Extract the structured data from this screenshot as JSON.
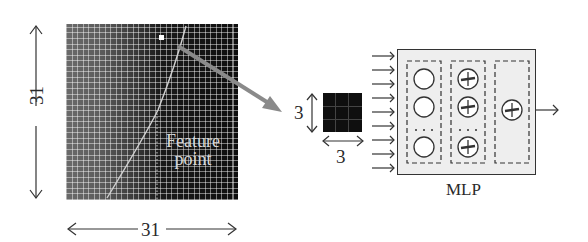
{
  "figure": {
    "image_patch": {
      "width_label": "31",
      "height_label": "31",
      "feature_label_line1": "Feature",
      "feature_label_line2": "point"
    },
    "small_patch": {
      "width_label": "3",
      "height_label": "3",
      "grid": "3x3"
    },
    "mlp": {
      "label": "MLP",
      "layers": [
        {
          "name": "input",
          "neurons": 3,
          "type": "plain-circle",
          "ellipsis": true
        },
        {
          "name": "hidden",
          "neurons": 3,
          "type": "plus-circle",
          "ellipsis": true
        },
        {
          "name": "output",
          "neurons": 1,
          "type": "plus-circle",
          "ellipsis": false
        }
      ],
      "input_arrows": 9
    },
    "colors": {
      "arrow_gray": "#8a8a8a",
      "mlp_fill": "#eeeeee",
      "stroke": "#333333"
    }
  }
}
